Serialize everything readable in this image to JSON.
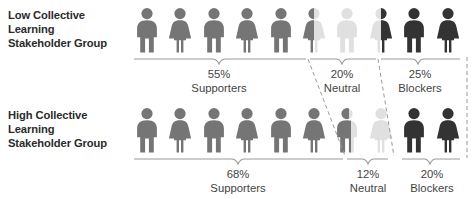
{
  "chart_data": {
    "type": "bar",
    "subtype": "pictogram-stacked-percentage",
    "title": "",
    "xlabel": "",
    "ylabel": "",
    "icon_unit_value": 10,
    "icon_unit_label": "1 figure = 10%",
    "categories": [
      "Low Collective Learning Stakeholder Group",
      "High Collective Learning Stakeholder Group"
    ],
    "segment_names": [
      "Supporters",
      "Neutral",
      "Blockers"
    ],
    "series": [
      {
        "name": "Supporters",
        "values": [
          55,
          68
        ]
      },
      {
        "name": "Neutral",
        "values": [
          20,
          12
        ]
      },
      {
        "name": "Blockers",
        "values": [
          25,
          20
        ]
      }
    ],
    "colors": {
      "supporters": "#757575",
      "neutral": "#e0e0e0",
      "blockers": "#333333",
      "bracket": "#9a9a9a",
      "text": "#444444",
      "title": "#2b2b2b"
    },
    "rows": [
      {
        "id": "low",
        "title_lines": [
          "Low Collective",
          "Learning",
          "Stakeholder Group"
        ],
        "figures": [
          {
            "gender": "male",
            "fill": "supporters"
          },
          {
            "gender": "female",
            "fill": "supporters"
          },
          {
            "gender": "male",
            "fill": "supporters"
          },
          {
            "gender": "female",
            "fill": "supporters"
          },
          {
            "gender": "male",
            "fill": "supporters"
          },
          {
            "gender": "female",
            "fill": "split",
            "left": "supporters",
            "right": "neutral",
            "split_at": 50
          },
          {
            "gender": "male",
            "fill": "neutral"
          },
          {
            "gender": "female",
            "fill": "split",
            "left": "neutral",
            "right": "blockers",
            "split_at": 50
          },
          {
            "gender": "male",
            "fill": "blockers"
          },
          {
            "gender": "female",
            "fill": "blockers"
          }
        ],
        "segments": [
          {
            "name": "Supporters",
            "pct_label": "55%",
            "value": 55
          },
          {
            "name": "Neutral",
            "pct_label": "20%",
            "value": 20
          },
          {
            "name": "Blockers",
            "pct_label": "25%",
            "value": 25
          }
        ]
      },
      {
        "id": "high",
        "title_lines": [
          "High Collective",
          "Learning",
          "Stakeholder Group"
        ],
        "figures": [
          {
            "gender": "male",
            "fill": "supporters"
          },
          {
            "gender": "female",
            "fill": "supporters"
          },
          {
            "gender": "male",
            "fill": "supporters"
          },
          {
            "gender": "female",
            "fill": "supporters"
          },
          {
            "gender": "male",
            "fill": "supporters"
          },
          {
            "gender": "female",
            "fill": "supporters"
          },
          {
            "gender": "male",
            "fill": "split",
            "left": "supporters",
            "right": "neutral",
            "split_at": 72
          },
          {
            "gender": "female",
            "fill": "neutral"
          },
          {
            "gender": "male",
            "fill": "blockers"
          },
          {
            "gender": "female",
            "fill": "blockers"
          }
        ],
        "segments": [
          {
            "name": "Supporters",
            "pct_label": "68%",
            "value": 68
          },
          {
            "name": "Neutral",
            "pct_label": "12%",
            "value": 12
          },
          {
            "name": "Blockers",
            "pct_label": "20%",
            "value": 20
          }
        ]
      }
    ]
  },
  "rows": {
    "low": {
      "title": "Low Collective\nLearning\nStakeholder Group",
      "title_l1": "Low Collective",
      "title_l2": "Learning",
      "title_l3": "Stakeholder Group",
      "seg1_pct": "55%",
      "seg1_name": "Supporters",
      "seg2_pct": "20%",
      "seg2_name": "Neutral",
      "seg3_pct": "25%",
      "seg3_name": "Blockers"
    },
    "high": {
      "title": "High Collective\nLearning\nStakeholder Group",
      "title_l1": "High Collective",
      "title_l2": "Learning",
      "title_l3": "Stakeholder Group",
      "seg1_pct": "68%",
      "seg1_name": "Supporters",
      "seg2_pct": "12%",
      "seg2_name": "Neutral",
      "seg3_pct": "20%",
      "seg3_name": "Blockers"
    }
  }
}
